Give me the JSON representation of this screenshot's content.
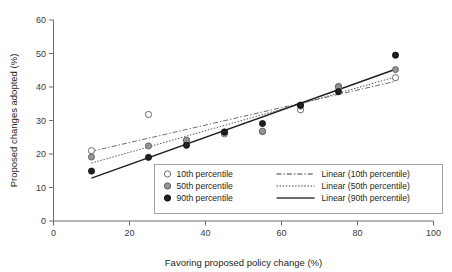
{
  "chart_data": {
    "type": "scatter",
    "title": "",
    "xlabel": "Favoring proposed policy change (%)",
    "ylabel": "Proposed changes adopted (%)",
    "xlim": [
      0,
      100
    ],
    "ylim": [
      0,
      60
    ],
    "xticks": [
      0,
      20,
      40,
      60,
      80,
      100
    ],
    "yticks": [
      0,
      10,
      20,
      30,
      40,
      50,
      60
    ],
    "xtick_labels": [
      "0",
      "20",
      "40",
      "60",
      "80",
      "100"
    ],
    "ytick_labels": [
      "0",
      "10",
      "20",
      "30",
      "40",
      "50",
      "60"
    ],
    "grid": false,
    "legend_position": "inside-lower-right",
    "series": [
      {
        "name": "10th percentile",
        "marker": "open-circle",
        "marker_fill": "#ffffff",
        "marker_stroke": "#58595b",
        "x": [
          10,
          25,
          35,
          45,
          55,
          65,
          75,
          90
        ],
        "y": [
          21.0,
          31.8,
          24.0,
          26.0,
          26.7,
          33.2,
          40.2,
          42.8
        ]
      },
      {
        "name": "50th percentile",
        "marker": "gray-circle",
        "marker_fill": "#939598",
        "marker_stroke": "#4d4d4d",
        "x": [
          10,
          25,
          35,
          45,
          55,
          65,
          75,
          90
        ],
        "y": [
          19.1,
          22.4,
          24.1,
          26.4,
          26.8,
          34.3,
          39.9,
          45.2
        ]
      },
      {
        "name": "90th percentile",
        "marker": "filled-circle",
        "marker_fill": "#231f20",
        "marker_stroke": "#000000",
        "x": [
          10,
          25,
          35,
          45,
          55,
          65,
          75,
          90
        ],
        "y": [
          14.9,
          19.0,
          22.6,
          26.6,
          29.1,
          34.6,
          38.6,
          49.5
        ]
      }
    ],
    "trendlines": [
      {
        "name": "Linear (10th percentile)",
        "style": "dash-dot",
        "color": "#6d6e71",
        "x_start": 10,
        "y_start": 20.8,
        "x_end": 90,
        "y_end": 41.7
      },
      {
        "name": "Linear (50th percentile)",
        "style": "dotted",
        "color": "#4d4f53",
        "x_start": 10,
        "y_start": 17.3,
        "x_end": 90,
        "y_end": 43.0
      },
      {
        "name": "Linear (90th percentile)",
        "style": "solid",
        "color": "#231f20",
        "x_start": 10,
        "y_start": 12.8,
        "x_end": 90,
        "y_end": 45.3
      }
    ],
    "legend_entries": [
      {
        "label": "10th percentile",
        "kind": "marker",
        "marker": "open-circle"
      },
      {
        "label": "50th percentile",
        "kind": "marker",
        "marker": "gray-circle"
      },
      {
        "label": "90th percentile",
        "kind": "marker",
        "marker": "filled-circle"
      },
      {
        "label": "Linear (10th percentile)",
        "kind": "line",
        "style": "dash-dot"
      },
      {
        "label": "Linear (50th percentile)",
        "kind": "line",
        "style": "dotted"
      },
      {
        "label": "Linear (90th percentile)",
        "kind": "line",
        "style": "solid"
      }
    ],
    "colors": {
      "open_marker_fill": "#ffffff",
      "open_marker_stroke": "#58595b",
      "mid_marker_fill": "#939598",
      "dark_marker_fill": "#231f20",
      "axis": "#6d6d6d",
      "text": "#231f20",
      "background": "#ffffff"
    }
  }
}
